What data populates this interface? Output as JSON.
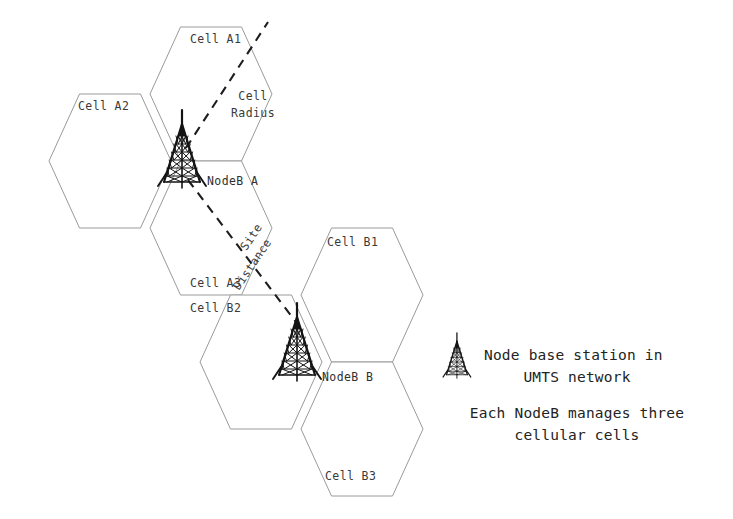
{
  "diagram": {
    "background_color": "#ffffff",
    "hex_stroke_color": "#9a9a9a",
    "dash_color": "#1d1d1d",
    "text_color": "#3a3a3a"
  },
  "cells": [
    {
      "id": "a1",
      "label": "Cell A1",
      "cluster": "A",
      "label_x": 190,
      "label_y": 43
    },
    {
      "id": "a2",
      "label": "Cell A2",
      "cluster": "A",
      "label_x": 78,
      "label_y": 110
    },
    {
      "id": "a3",
      "label": "Cell A3",
      "cluster": "A",
      "label_x": 190,
      "label_y": 287
    },
    {
      "id": "b1",
      "label": "Cell B1",
      "cluster": "B",
      "label_x": 327,
      "label_y": 246
    },
    {
      "id": "b2",
      "label": "Cell B2",
      "cluster": "B",
      "label_x": 190,
      "label_y": 312
    },
    {
      "id": "b3",
      "label": "Cell B3",
      "cluster": "B",
      "label_x": 325,
      "label_y": 480
    }
  ],
  "nodes": [
    {
      "id": "nodeb_a",
      "label": "NodeB A",
      "label_x": 207,
      "label_y": 185,
      "tower_x": 184,
      "tower_y": 123,
      "tower_scale": 1.0
    },
    {
      "id": "nodeb_b",
      "label": "NodeB B",
      "label_x": 322,
      "label_y": 381,
      "tower_x": 299,
      "tower_y": 316,
      "tower_scale": 1.0
    }
  ],
  "measurements": [
    {
      "id": "cell_radius",
      "label_lines": [
        "Cell",
        "Radius"
      ],
      "label_x": 253,
      "label_y": 100,
      "line_x1": 186,
      "line_y1": 148,
      "line_x2": 268,
      "line_y2": 22
    },
    {
      "id": "site_distance",
      "label_lines": [
        "Site",
        "Distance"
      ],
      "label_x": 250,
      "label_y": 253,
      "rotation_deg": -56,
      "line_x1": 188,
      "line_y1": 180,
      "line_x2": 302,
      "line_y2": 330
    }
  ],
  "legend": {
    "tower_icon_name": "node-base-station-tower-icon",
    "tower_x": 455,
    "tower_y": 337,
    "items": [
      {
        "id": "legend_node_base_station",
        "lines": [
          "Node base station in",
          "UMTS network"
        ],
        "line_positions": [
          {
            "x": 484,
            "y": 360,
            "align": "start"
          },
          {
            "x": 577,
            "y": 382,
            "align": "middle"
          }
        ]
      },
      {
        "id": "legend_nodeb_manages",
        "lines": [
          "Each NodeB manages three",
          "cellular cells"
        ],
        "line_positions": [
          {
            "x": 577,
            "y": 418,
            "align": "middle"
          },
          {
            "x": 577,
            "y": 440,
            "align": "middle"
          }
        ]
      }
    ]
  },
  "hex_geometry": {
    "note": "flat-top-left pointy-side hexagons; width 121, height 134",
    "hexes": [
      {
        "id": "a1",
        "cx": 211,
        "cy": 94
      },
      {
        "id": "a2",
        "cx": 110,
        "cy": 161
      },
      {
        "id": "a3",
        "cx": 211,
        "cy": 228
      },
      {
        "id": "b1",
        "cx": 362,
        "cy": 295
      },
      {
        "id": "b2",
        "cx": 261,
        "cy": 362
      },
      {
        "id": "b3",
        "cx": 362,
        "cy": 429
      }
    ]
  }
}
